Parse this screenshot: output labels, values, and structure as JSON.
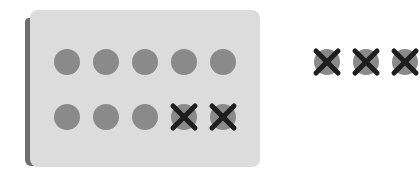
{
  "diagram": {
    "title": "",
    "card": {
      "rows": 2,
      "cols": 5,
      "total": 10,
      "crossed": 2
    },
    "card_items": [
      {
        "row": 0,
        "col": 0,
        "crossed": false
      },
      {
        "row": 0,
        "col": 1,
        "crossed": false
      },
      {
        "row": 0,
        "col": 2,
        "crossed": false
      },
      {
        "row": 0,
        "col": 3,
        "crossed": false
      },
      {
        "row": 0,
        "col": 4,
        "crossed": false
      },
      {
        "row": 1,
        "col": 0,
        "crossed": false
      },
      {
        "row": 1,
        "col": 1,
        "crossed": false
      },
      {
        "row": 1,
        "col": 2,
        "crossed": false
      },
      {
        "row": 1,
        "col": 3,
        "crossed": true
      },
      {
        "row": 1,
        "col": 4,
        "crossed": true
      }
    ],
    "outside_items": {
      "count": 3,
      "crossed": true
    },
    "colors": {
      "card": "#dcdcdc",
      "circle": "#8a8a8a",
      "cross": "#1e1e1e",
      "shadow": "#6e6e6e"
    }
  }
}
